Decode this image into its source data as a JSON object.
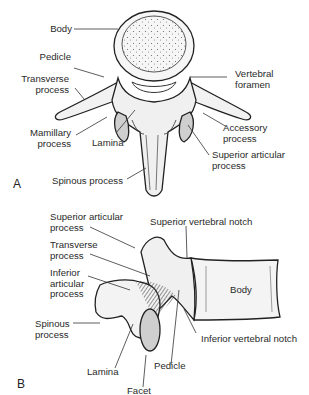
{
  "figure": {
    "panel_a": {
      "letter": "A",
      "view": "superior",
      "labels": {
        "body": "Body",
        "pedicle": "Pedicle",
        "transverse_1": "Transverse",
        "transverse_2": "process",
        "mamillary_1": "Mamillary",
        "mamillary_2": "process",
        "lamina": "Lamina",
        "spinous": "Spinous process",
        "foramen_1": "Vertebral",
        "foramen_2": "foramen",
        "accessory_1": "Accessory",
        "accessory_2": "process",
        "sup_art_1": "Superior articular",
        "sup_art_2": "process"
      }
    },
    "panel_b": {
      "letter": "B",
      "view": "lateral",
      "labels": {
        "sup_art_1": "Superior articular",
        "sup_art_2": "process",
        "transverse_1": "Transverse",
        "transverse_2": "process",
        "inf_art_1": "Inferior",
        "inf_art_2": "articular",
        "inf_art_3": "process",
        "spinous_1": "Spinous",
        "spinous_2": "process",
        "lamina": "Lamina",
        "facet": "Facet",
        "pedicle": "Pedicle",
        "sup_notch": "Superior vertebral notch",
        "inf_notch": "Inferior vertebral notch",
        "body": "Body"
      }
    },
    "colors": {
      "ink": "#222222",
      "shade": "#bdbdbd",
      "facet": "#cfcfcf",
      "body_fill": "#f4f4f4"
    }
  }
}
